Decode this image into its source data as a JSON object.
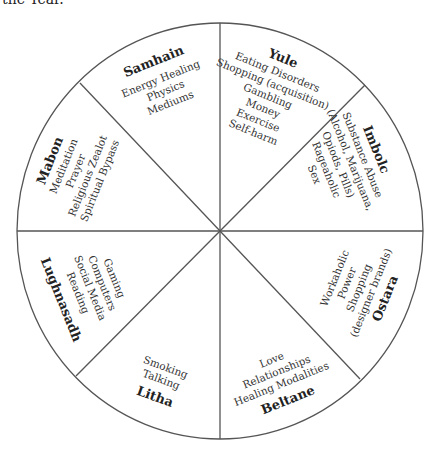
{
  "caption": "the Year.",
  "wheel": {
    "stroke_color": "#555555",
    "segments": [
      {
        "name": "Samhain",
        "items": [
          "Energy Healing",
          "Physics",
          "Mediums"
        ]
      },
      {
        "name": "Yule",
        "items": [
          "Eating Disorders",
          "Shopping (acquisition)",
          "Gambling",
          "Money",
          "Exercise",
          "Self-harm"
        ]
      },
      {
        "name": "Imbolc",
        "items": [
          "Substance Abuse",
          "(Alcohol, Marijuana,",
          "Opiods, Pills)",
          "Rageaholic",
          "Sex"
        ]
      },
      {
        "name": "Ostara",
        "items": [
          "Workaholic",
          "Power",
          "Shopping",
          "(designer brands)"
        ]
      },
      {
        "name": "Beltane",
        "items": [
          "Love",
          "Relationships",
          "Healing Modalities"
        ]
      },
      {
        "name": "Litha",
        "items": [
          "Smoking",
          "Talking"
        ]
      },
      {
        "name": "Lughnasadh",
        "items": [
          "Gaming",
          "Computers",
          "Social Media",
          "Reading"
        ]
      },
      {
        "name": "Mabon",
        "items": [
          "Meditation",
          "Prayer",
          "Religious Zealot",
          "Spiritual Bypass"
        ]
      }
    ]
  }
}
